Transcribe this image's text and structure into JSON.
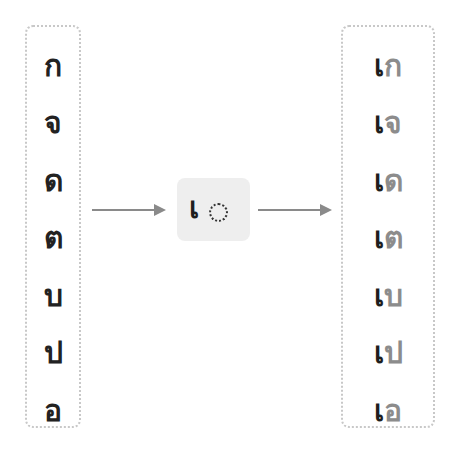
{
  "left_column": {
    "consonants": [
      "ก",
      "จ",
      "ด",
      "ต",
      "บ",
      "ป",
      "อ"
    ]
  },
  "middle": {
    "vowel": "เ",
    "placeholder": "dotted-circle"
  },
  "right_column": {
    "syllables": [
      {
        "vowel": "เ",
        "consonant": "ก"
      },
      {
        "vowel": "เ",
        "consonant": "จ"
      },
      {
        "vowel": "เ",
        "consonant": "ด"
      },
      {
        "vowel": "เ",
        "consonant": "ต"
      },
      {
        "vowel": "เ",
        "consonant": "บ"
      },
      {
        "vowel": "เ",
        "consonant": "ป"
      },
      {
        "vowel": "เ",
        "consonant": "อ"
      }
    ]
  },
  "colors": {
    "vowel": "#1e1e1e",
    "consonant_in_result": "#8c8c8c",
    "arrow": "#8a8a8a",
    "box_border": "#c8c8c8",
    "middle_box_bg": "#eeeeee"
  }
}
